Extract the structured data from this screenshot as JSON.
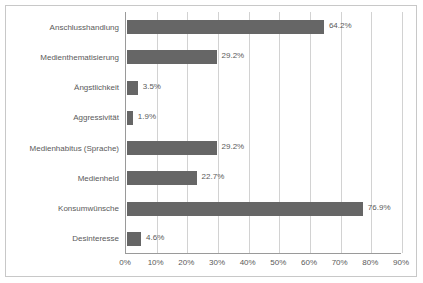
{
  "chart_data": {
    "type": "bar",
    "orientation": "horizontal",
    "title": "",
    "xlabel": "",
    "ylabel": "",
    "xlim": [
      0,
      90
    ],
    "grid": true,
    "legend": false,
    "categories": [
      "Anschlusshandlung",
      "Medienthematisierung",
      "Ängstlichkeit",
      "Aggressivität",
      "Medienhabitus (Sprache)",
      "Medienheld",
      "Konsumwünsche",
      "Desinteresse"
    ],
    "values": [
      64.2,
      29.2,
      3.5,
      1.9,
      29.2,
      22.7,
      76.9,
      4.6
    ],
    "value_labels": [
      "64.2%",
      "29.2%",
      "3.5%",
      "1.9%",
      "29.2%",
      "22.7%",
      "76.9%",
      "4.6%"
    ],
    "xticks": [
      0,
      10,
      20,
      30,
      40,
      50,
      60,
      70,
      80,
      90
    ],
    "xtick_labels": [
      "0%",
      "10%",
      "20%",
      "30%",
      "40%",
      "50%",
      "60%",
      "70%",
      "80%",
      "90%"
    ],
    "bar_color": "#666666",
    "gridline_color": "#d2d2d2",
    "axis_color": "#9a9a9a",
    "text_color": "#5a5a5a",
    "background_color": "#ffffff",
    "border_color": "#c8c8c8"
  }
}
